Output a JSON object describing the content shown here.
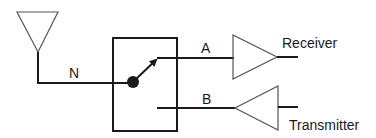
{
  "diagram": {
    "type": "rf-switch-block-diagram",
    "colors": {
      "line": "#1a1a1a",
      "background": "#ffffff"
    },
    "labels": {
      "antenna_line": "N",
      "port_a": "A",
      "port_b": "B",
      "receiver": "Receiver",
      "transmitter": "Transmitter"
    },
    "nodes": [
      {
        "id": "antenna",
        "icon": "antenna-icon"
      },
      {
        "id": "switch",
        "icon": "switch-box-icon"
      },
      {
        "id": "receiver",
        "icon": "amplifier-triangle-right-icon",
        "label": "Receiver"
      },
      {
        "id": "transmitter",
        "icon": "amplifier-triangle-left-icon",
        "label": "Transmitter"
      }
    ],
    "edges": [
      {
        "from": "antenna",
        "to": "switch",
        "label": "N"
      },
      {
        "from": "switch",
        "to": "receiver",
        "label": "A"
      },
      {
        "from": "transmitter",
        "to": "switch",
        "label": "B"
      }
    ]
  }
}
